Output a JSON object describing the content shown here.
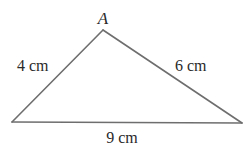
{
  "diagram": {
    "type": "triangle",
    "vertices": [
      {
        "id": "apex",
        "label": "A"
      },
      {
        "id": "bottom-left",
        "label": ""
      },
      {
        "id": "bottom-right",
        "label": ""
      }
    ],
    "sides": [
      {
        "id": "left",
        "from": "apex",
        "to": "bottom-left",
        "length_label": "4 cm"
      },
      {
        "id": "right",
        "from": "apex",
        "to": "bottom-right",
        "length_label": "6 cm"
      },
      {
        "id": "base",
        "from": "bottom-left",
        "to": "bottom-right",
        "length_label": "9 cm"
      }
    ],
    "line_color": "#6e6e6e",
    "text_color": "#2a2a2a"
  }
}
